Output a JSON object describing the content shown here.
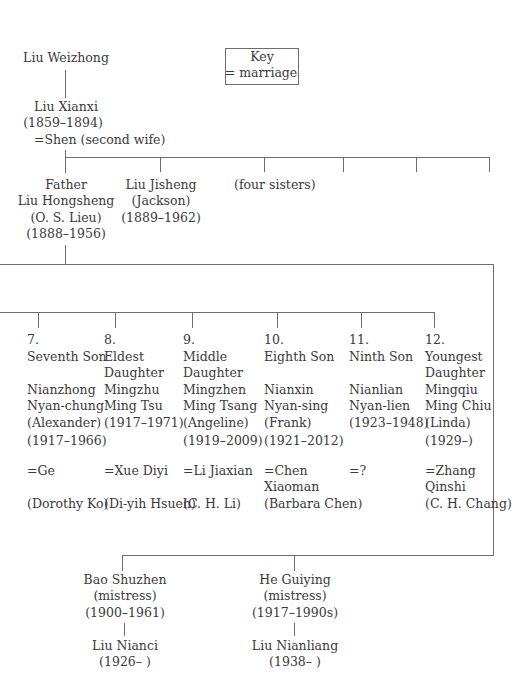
{
  "key": {
    "title": "Key",
    "legend": "= marriage"
  },
  "root": {
    "name": "Liu Weizhong"
  },
  "grandfather": {
    "name": "Liu Xianxi",
    "dates": "(1859–1894)",
    "spouse": "=Shen (second wife)"
  },
  "generation2": {
    "father": {
      "role": "Father",
      "name": "Liu Hongsheng",
      "alias": "(O. S. Lieu)",
      "dates": "(1888–1956)"
    },
    "brother": {
      "name": "Liu Jisheng",
      "alias": "(Jackson)",
      "dates": "(1889–1962)"
    },
    "sisters": {
      "label": "(four sisters)"
    }
  },
  "children": [
    {
      "number": "7.",
      "role1": "Seventh Son",
      "role2": "",
      "name1": "Nianzhong",
      "name2": "Nyan-chung",
      "alias": "(Alexander)",
      "dates": "(1917–1966)",
      "spouse1": "=Ge",
      "spouse2": "",
      "spouse_alias": "(Dorothy Ko)"
    },
    {
      "number": "8.",
      "role1": "Eldest",
      "role2": "Daughter",
      "name1": "Mingzhu",
      "name2": "Ming Tsu",
      "alias": "(1917–1971)",
      "dates": "",
      "spouse1": "=Xue Diyi",
      "spouse2": "",
      "spouse_alias": "(Di-yih Hsueh)"
    },
    {
      "number": "9.",
      "role1": "Middle",
      "role2": "Daughter",
      "name1": "Mingzhen",
      "name2": "Ming Tsang",
      "alias": "(Angeline)",
      "dates": "(1919–2009)",
      "spouse1": "=Li Jiaxian",
      "spouse2": "",
      "spouse_alias": "(C. H. Li)"
    },
    {
      "number": "10.",
      "role1": "Eighth Son",
      "role2": "",
      "name1": "Nianxin",
      "name2": "Nyan-sing",
      "alias": "(Frank)",
      "dates": "(1921–2012)",
      "spouse1": "=Chen",
      "spouse2": "Xiaoman",
      "spouse_alias": "(Barbara Chen)"
    },
    {
      "number": "11.",
      "role1": "Ninth Son",
      "role2": "",
      "name1": "Nianlian",
      "name2": "Nyan-lien",
      "alias": "(1923–1948)",
      "dates": "",
      "spouse1": "=?",
      "spouse2": "",
      "spouse_alias": ""
    },
    {
      "number": "12.",
      "role1": "Youngest",
      "role2": "Daughter",
      "name1": "Mingqiu",
      "name2": "Ming Chiu",
      "alias": "(Linda)",
      "dates": "(1929–)",
      "spouse1": "=Zhang",
      "spouse2": "Qinshi",
      "spouse_alias": "(C. H. Chang)"
    }
  ],
  "mistresses": [
    {
      "name": "Bao Shuzhen",
      "role": "(mistress)",
      "dates": "(1900–1961)",
      "child_name": "Liu Nianci",
      "child_dates": "(1926– )"
    },
    {
      "name": "He Guiying",
      "role": "(mistress)",
      "dates": "(1917–1990s)",
      "child_name": "Liu Nianliang",
      "child_dates": "(1938– )"
    }
  ]
}
